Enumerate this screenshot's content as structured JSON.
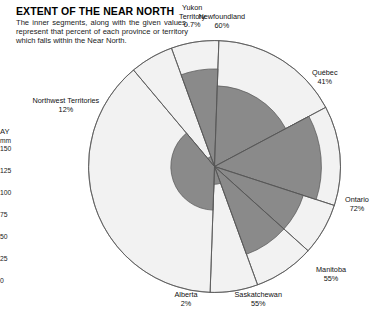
{
  "header": {
    "title": "EXTENT OF THE NEAR NORTH",
    "description": "The inner segments, along with the given values, represent that percent of each province or territory which falls within the Near North."
  },
  "side_axis": {
    "title": "AY",
    "unit": "mm",
    "ticks": [
      "150",
      "125",
      "100",
      "75",
      "50",
      "25",
      "0"
    ]
  },
  "colors": {
    "segment_fill": "#8a8a8a",
    "outer_fill": "#f2f2f2",
    "outline": "#555555",
    "text": "#111111"
  },
  "chart_data": {
    "type": "pie",
    "title": "EXTENT OF THE NEAR NORTH",
    "xlabel": "",
    "ylabel": "",
    "note": "Each wedge is a province/territory; the shaded inner sector radius encodes the percent of that region within the Near North.",
    "value_unit": "%",
    "categories": [
      "Newfoundland",
      "Québec",
      "Ontario",
      "Manitoba",
      "Saskatchewan",
      "Alberta",
      "Northwest Territories",
      "Yukon Territory"
    ],
    "values": [
      60,
      41,
      72,
      55,
      55,
      2,
      12,
      0.7
    ],
    "labels": [
      {
        "name": "Newfoundland",
        "percent": "60%",
        "value": 60
      },
      {
        "name": "Québec",
        "percent": "41%",
        "value": 41
      },
      {
        "name": "Ontario",
        "percent": "72%",
        "value": 72
      },
      {
        "name": "Manitoba",
        "percent": "55%",
        "value": 55
      },
      {
        "name": "Saskatchewan",
        "percent": "55%",
        "value": 55
      },
      {
        "name": "Alberta",
        "percent": "2%",
        "value": 2
      },
      {
        "name": "Northwest Territories",
        "percent": "12%",
        "value": 12
      },
      {
        "name": "Yukon Territory",
        "percent": "0.7%",
        "value": 0.7
      }
    ],
    "wedges": [
      {
        "name": "Newfoundland",
        "start_deg": -20,
        "end_deg": 2,
        "pct": 60
      },
      {
        "name": "Québec",
        "start_deg": 2,
        "end_deg": 62,
        "pct": 41
      },
      {
        "name": "Ontario",
        "start_deg": 62,
        "end_deg": 108,
        "pct": 72
      },
      {
        "name": "Manitoba",
        "start_deg": 108,
        "end_deg": 132,
        "pct": 55
      },
      {
        "name": "Saskatchewan",
        "start_deg": 132,
        "end_deg": 160,
        "pct": 55
      },
      {
        "name": "Alberta",
        "start_deg": 160,
        "end_deg": 182,
        "pct": 2
      },
      {
        "name": "Northwest Territories",
        "start_deg": 182,
        "end_deg": 320,
        "pct": 12
      },
      {
        "name": "Yukon Territory",
        "start_deg": 320,
        "end_deg": 340,
        "pct": 0.7
      }
    ],
    "legend_position": "callout-labels",
    "grid": false
  },
  "callouts": {
    "yukon": {
      "name": "Yukon",
      "name2": "Territory",
      "percent": "0.7%"
    },
    "newfoundland": {
      "name": "Newfoundland",
      "percent": "60%"
    },
    "quebec": {
      "name": "Québec",
      "percent": "41%"
    },
    "ontario": {
      "name": "Ontario",
      "percent": "72%"
    },
    "manitoba": {
      "name": "Manitoba",
      "percent": "55%"
    },
    "saskatchewan": {
      "name": "Saskatchewan",
      "percent": "55%"
    },
    "alberta": {
      "name": "Alberta",
      "percent": "2%"
    },
    "nwt": {
      "name": "Northwest Territories",
      "percent": "12%"
    }
  }
}
